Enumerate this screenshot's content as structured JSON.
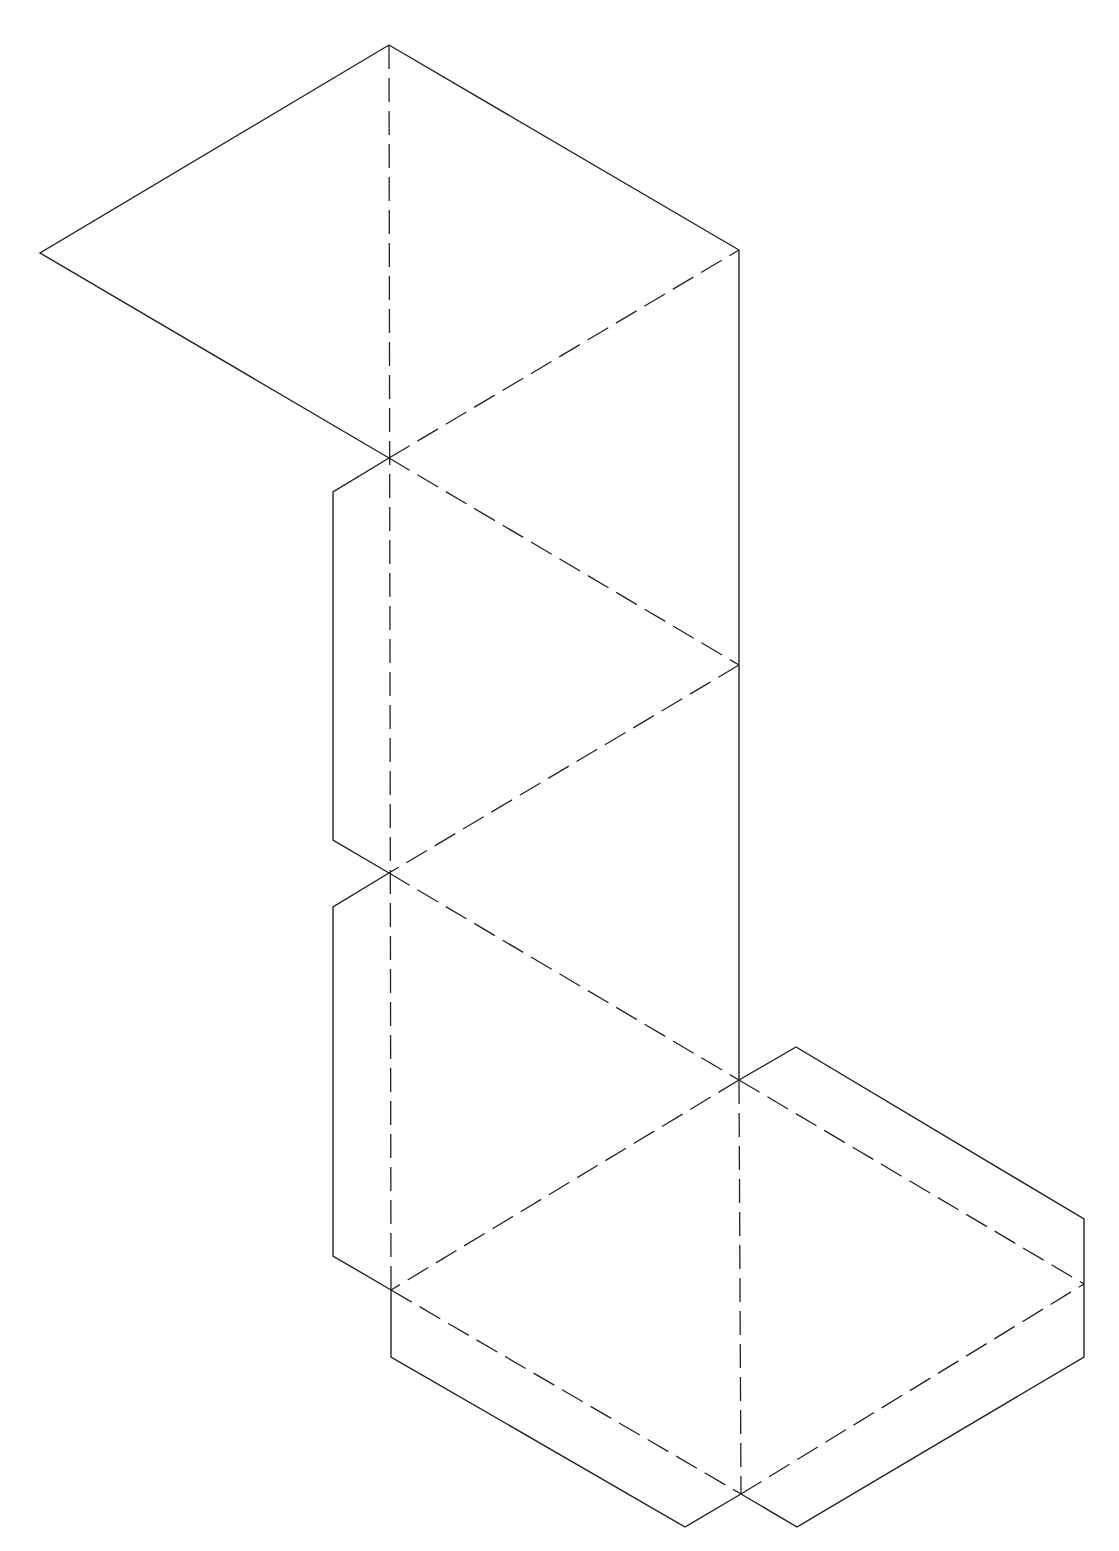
{
  "diagram": {
    "type": "polyhedron-net",
    "colors": {
      "background": "#ffffff",
      "line": "#222222"
    },
    "cut_lines": [
      {
        "name": "top-left-face-outline",
        "points": [
          [
            389,
            45
          ],
          [
            40,
            253
          ],
          [
            389,
            458
          ]
        ]
      },
      {
        "name": "top-right-edge",
        "points": [
          [
            389,
            45
          ],
          [
            739,
            250
          ]
        ]
      },
      {
        "name": "right-spine",
        "points": [
          [
            739,
            250
          ],
          [
            739,
            1080
          ]
        ]
      },
      {
        "name": "upper-left-tab",
        "points": [
          [
            389,
            458
          ],
          [
            333,
            492
          ],
          [
            333,
            840
          ],
          [
            389,
            873
          ]
        ]
      },
      {
        "name": "lower-left-tab",
        "points": [
          [
            389,
            873
          ],
          [
            333,
            907
          ],
          [
            333,
            1256
          ],
          [
            391,
            1290
          ]
        ]
      },
      {
        "name": "right-tab",
        "points": [
          [
            739,
            1080
          ],
          [
            796,
            1047
          ],
          [
            1084,
            1219
          ],
          [
            1084,
            1284
          ]
        ]
      },
      {
        "name": "right-lower-tab",
        "points": [
          [
            1084,
            1284
          ],
          [
            1084,
            1357
          ],
          [
            797,
            1527
          ],
          [
            741,
            1494
          ]
        ]
      },
      {
        "name": "bottom-tab",
        "points": [
          [
            391,
            1290
          ],
          [
            391,
            1357
          ],
          [
            685,
            1527
          ],
          [
            741,
            1494
          ]
        ]
      }
    ],
    "fold_lines": [
      {
        "name": "vertical-spine-fold",
        "points": [
          [
            389,
            45
          ],
          [
            391,
            1290
          ]
        ]
      },
      {
        "name": "fold-c1-tr",
        "points": [
          [
            389,
            458
          ],
          [
            739,
            250
          ]
        ]
      },
      {
        "name": "fold-c1-r1",
        "points": [
          [
            389,
            458
          ],
          [
            739,
            665
          ]
        ]
      },
      {
        "name": "fold-r1-c2",
        "points": [
          [
            739,
            665
          ],
          [
            389,
            873
          ]
        ]
      },
      {
        "name": "fold-c2-r2",
        "points": [
          [
            389,
            873
          ],
          [
            739,
            1080
          ]
        ]
      },
      {
        "name": "fold-r2-bl",
        "points": [
          [
            739,
            1080
          ],
          [
            391,
            1290
          ]
        ]
      },
      {
        "name": "fold-r2-rr",
        "points": [
          [
            739,
            1080
          ],
          [
            1084,
            1284
          ]
        ]
      },
      {
        "name": "fold-r2-b",
        "points": [
          [
            739,
            1080
          ],
          [
            741,
            1494
          ]
        ]
      },
      {
        "name": "fold-bl-b",
        "points": [
          [
            391,
            1290
          ],
          [
            741,
            1494
          ]
        ]
      },
      {
        "name": "fold-b-rr",
        "points": [
          [
            741,
            1494
          ],
          [
            1084,
            1284
          ]
        ]
      }
    ]
  }
}
